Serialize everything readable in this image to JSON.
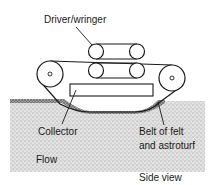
{
  "diagram": {
    "type": "mechanical side-view schematic",
    "labels": {
      "driver": "Driver/wringer",
      "collector": "Collector",
      "belt_line1": "Belt of felt",
      "belt_line2": "and astroturf",
      "flow": "Flow",
      "caption": "Side view"
    },
    "components": [
      {
        "id": "driver-wringer",
        "kind": "pair of belted roller sets"
      },
      {
        "id": "left-pulley",
        "kind": "large pulley"
      },
      {
        "id": "right-pulley",
        "kind": "large pulley"
      },
      {
        "id": "collector",
        "kind": "rectangular tray"
      },
      {
        "id": "belt",
        "kind": "continuous belt dipping into flow"
      },
      {
        "id": "flow",
        "kind": "stippled liquid region"
      }
    ],
    "colors": {
      "ink": "#1a1a1a",
      "flow_fill": "#d9d9d9",
      "background": "#ffffff"
    }
  }
}
